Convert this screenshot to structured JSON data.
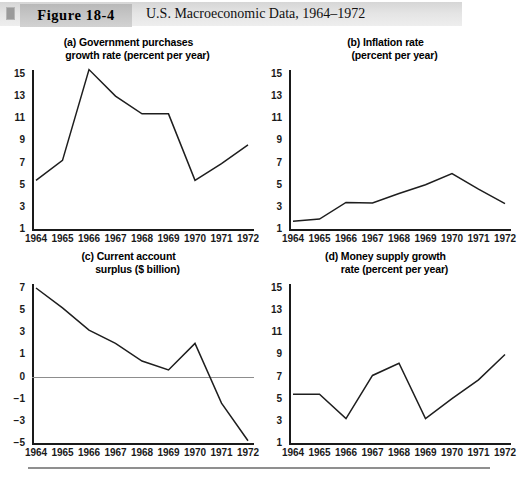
{
  "header": {
    "figure_number": "Figure 18-4",
    "caption": "U.S. Macroeconomic Data, 1964–1972",
    "corner_icon": "page-corner-icon",
    "band_color": "#e0e0e0",
    "number_box_color": "#c4c4c4"
  },
  "chart_data": [
    {
      "id": "panel-a",
      "type": "line",
      "title": "(a) Government purchases\n      growth rate (percent per year)",
      "title_line1": "(a) Government purchases",
      "title_line2": "growth rate (percent per year)",
      "xlabel": "",
      "ylabel": "percent per year",
      "categories": [
        "1964",
        "1965",
        "1966",
        "1967",
        "1968",
        "1969",
        "1970",
        "1971",
        "1972"
      ],
      "x": [
        1964,
        1965,
        1966,
        1967,
        1968,
        1969,
        1970,
        1971,
        1972
      ],
      "values": [
        5.4,
        7.2,
        15.4,
        13.0,
        11.4,
        11.4,
        5.4,
        6.9,
        8.6
      ],
      "yticks": [
        15,
        13,
        11,
        9,
        7,
        5,
        3,
        1
      ],
      "ylim": [
        1,
        16
      ],
      "grid": false,
      "legend": "none",
      "line_color": "#1e1e1e"
    },
    {
      "id": "panel-b",
      "type": "line",
      "title": "(b) Inflation rate\n      (percent per year)",
      "title_line1": "(b) Inflation rate",
      "title_line2": "(percent per year)",
      "xlabel": "",
      "ylabel": "percent per year",
      "categories": [
        "1964",
        "1965",
        "1966",
        "1967",
        "1968",
        "1969",
        "1970",
        "1971",
        "1972"
      ],
      "x": [
        1964,
        1965,
        1966,
        1967,
        1968,
        1969,
        1970,
        1971,
        1972
      ],
      "values": [
        1.7,
        1.9,
        3.4,
        3.35,
        4.2,
        5.0,
        6.0,
        4.6,
        3.3
      ],
      "yticks": [
        15,
        13,
        11,
        9,
        7,
        5,
        3,
        1
      ],
      "ylim": [
        1,
        16
      ],
      "grid": false,
      "legend": "none",
      "line_color": "#1e1e1e"
    },
    {
      "id": "panel-c",
      "type": "line",
      "title": "(c) Current account\n      surplus ($ billion)",
      "title_line1": "(c) Current account",
      "title_line2": "surplus ($ billion)",
      "xlabel": "",
      "ylabel": "$ billion",
      "categories": [
        "1964",
        "1965",
        "1966",
        "1967",
        "1968",
        "1969",
        "1970",
        "1971",
        "1972"
      ],
      "x": [
        1964,
        1965,
        1966,
        1967,
        1968,
        1969,
        1970,
        1971,
        1972
      ],
      "values": [
        7.0,
        5.2,
        3.2,
        2.0,
        0.7,
        0.3,
        2.0,
        -1.4,
        -4.8
      ],
      "yticks": [
        7,
        5,
        3,
        1,
        0,
        -1,
        -3,
        -5
      ],
      "ylim": [
        -5,
        7
      ],
      "zero_line": 0,
      "grid": false,
      "legend": "none",
      "line_color": "#1e1e1e",
      "zero_line_color": "#8d8d8d"
    },
    {
      "id": "panel-d",
      "type": "line",
      "title": "(d) Money supply growth\n      rate (percent per year)",
      "title_line1": "(d) Money supply growth",
      "title_line2": "rate (percent per year)",
      "xlabel": "",
      "ylabel": "percent per year",
      "categories": [
        "1964",
        "1965",
        "1966",
        "1967",
        "1968",
        "1969",
        "1970",
        "1971",
        "1972"
      ],
      "x": [
        1964,
        1965,
        1966,
        1967,
        1968,
        1969,
        1970,
        1971,
        1972
      ],
      "values": [
        5.4,
        5.4,
        3.2,
        7.1,
        8.2,
        3.2,
        5.0,
        6.7,
        9.0
      ],
      "yticks": [
        15,
        13,
        11,
        9,
        7,
        5,
        3,
        1
      ],
      "ylim": [
        1,
        16
      ],
      "grid": false,
      "legend": "none",
      "line_color": "#1e1e1e"
    }
  ]
}
